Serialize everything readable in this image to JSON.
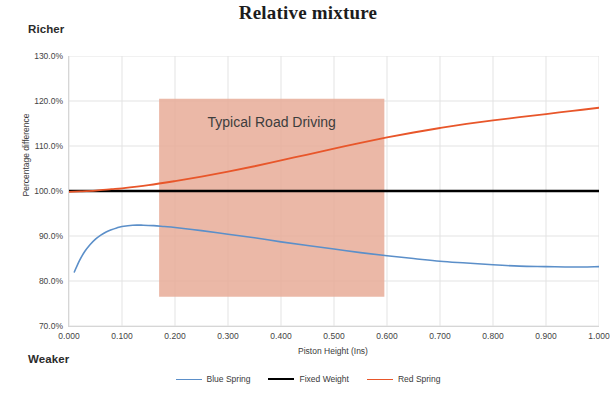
{
  "chart_data": {
    "type": "line",
    "title": "Relative mixture",
    "xlabel": "Piston Height (Ins)",
    "ylabel": "Percentage difference",
    "xlim": [
      0.0,
      1.0
    ],
    "ylim": [
      70.0,
      130.0
    ],
    "grid": true,
    "legend_position": "bottom",
    "xticks": [
      "0.000",
      "0.100",
      "0.200",
      "0.300",
      "0.400",
      "0.500",
      "0.600",
      "0.700",
      "0.800",
      "0.900",
      "1.000"
    ],
    "xtick_values": [
      0.0,
      0.1,
      0.2,
      0.3,
      0.4,
      0.5,
      0.6,
      0.7,
      0.8,
      0.9,
      1.0
    ],
    "yticks": [
      "70.0%",
      "80.0%",
      "90.0%",
      "100.0%",
      "110.0%",
      "120.0%",
      "130.0%"
    ],
    "ytick_values": [
      70,
      80,
      90,
      100,
      110,
      120,
      130
    ],
    "annotations": [
      {
        "text": "Richer",
        "position": "top-left-outside"
      },
      {
        "text": "Weaker",
        "position": "bottom-left-outside"
      },
      {
        "text": "Typical Road Driving",
        "position": "inside-band"
      }
    ],
    "shaded_region": {
      "label": "Typical Road Driving",
      "x_start": 0.17,
      "x_end": 0.595,
      "y_start": 76.5,
      "y_end": 120.5,
      "color": "#e8ab98",
      "opacity": 0.85
    },
    "series": [
      {
        "name": "Blue Spring",
        "color": "#5b8fc9",
        "x": [
          0.01,
          0.02,
          0.03,
          0.04,
          0.05,
          0.06,
          0.07,
          0.08,
          0.09,
          0.1,
          0.12,
          0.14,
          0.16,
          0.18,
          0.2,
          0.25,
          0.3,
          0.35,
          0.4,
          0.45,
          0.5,
          0.55,
          0.6,
          0.65,
          0.7,
          0.75,
          0.8,
          0.85,
          0.9,
          0.95,
          1.0
        ],
        "values": [
          82.0,
          84.6,
          86.6,
          88.1,
          89.3,
          90.2,
          90.9,
          91.4,
          91.8,
          92.1,
          92.4,
          92.4,
          92.3,
          92.1,
          91.9,
          91.2,
          90.4,
          89.6,
          88.7,
          87.9,
          87.1,
          86.3,
          85.6,
          85.0,
          84.4,
          84.0,
          83.6,
          83.3,
          83.2,
          83.1,
          83.2
        ]
      },
      {
        "name": "Fixed Weight",
        "color": "#000000",
        "x": [
          0.0,
          0.1,
          0.2,
          0.3,
          0.4,
          0.5,
          0.6,
          0.7,
          0.8,
          0.9,
          1.0
        ],
        "values": [
          100.0,
          100.0,
          100.0,
          100.0,
          100.0,
          100.0,
          100.0,
          100.0,
          100.0,
          100.0,
          100.0
        ]
      },
      {
        "name": "Red Spring",
        "color": "#e8562a",
        "x": [
          0.0,
          0.02,
          0.05,
          0.08,
          0.1,
          0.15,
          0.2,
          0.25,
          0.3,
          0.35,
          0.4,
          0.45,
          0.5,
          0.55,
          0.6,
          0.65,
          0.7,
          0.75,
          0.8,
          0.85,
          0.9,
          0.95,
          1.0
        ],
        "values": [
          99.8,
          99.9,
          100.1,
          100.4,
          100.6,
          101.3,
          102.2,
          103.2,
          104.3,
          105.5,
          106.8,
          108.1,
          109.4,
          110.7,
          111.9,
          113.0,
          114.0,
          114.9,
          115.7,
          116.4,
          117.1,
          117.8,
          118.5
        ]
      }
    ]
  },
  "legend": {
    "items": [
      {
        "label": "Blue Spring",
        "color": "#5b8fc9",
        "width": 1.6
      },
      {
        "label": "Fixed Weight",
        "color": "#000000",
        "width": 2.6
      },
      {
        "label": "Red Spring",
        "color": "#e8562a",
        "width": 1.8
      }
    ]
  }
}
